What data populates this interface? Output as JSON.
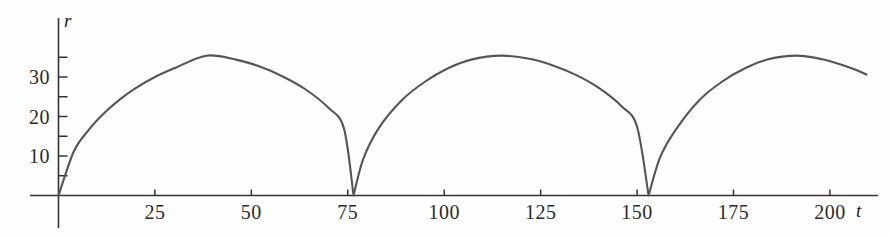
{
  "chart_data": {
    "type": "line",
    "title": "",
    "subtitle": "",
    "xlabel": "t",
    "ylabel": "r",
    "xlim": [
      -2,
      212
    ],
    "ylim": [
      0,
      39
    ],
    "grid": false,
    "legend": null,
    "x_ticks": [
      25,
      50,
      75,
      100,
      125,
      150,
      175,
      200
    ],
    "x_tick_labels": [
      "25",
      "50",
      "75",
      "100",
      "125",
      "150",
      "175",
      "200"
    ],
    "x_minor_tick_step": 25,
    "y_ticks": [
      5,
      10,
      15,
      20,
      25,
      30,
      35
    ],
    "y_tick_labels": [
      "",
      "10",
      "",
      "20",
      "",
      "30",
      ""
    ],
    "y_labeled_ticks": [
      10,
      20,
      30
    ],
    "line_color": "#555555",
    "axis_color": "#333333",
    "series": [
      {
        "name": "r(t)",
        "description": "periodic cycloid-like arcs with cusps at t = 0, 76.5, 153",
        "period": 76.5,
        "amplitude_max": 35.4,
        "cusps": [
          0,
          76.5,
          153
        ],
        "peaks": [
          {
            "x": 38.3,
            "y": 35.4
          },
          {
            "x": 114.8,
            "y": 35.4
          },
          {
            "x": 191.3,
            "y": 35.4
          }
        ],
        "x": [
          0,
          4,
          8,
          12,
          16,
          20,
          25,
          30,
          38.3,
          46,
          52,
          58,
          64,
          70,
          74,
          76.5,
          79,
          83,
          89,
          95,
          101,
          107,
          114.8,
          122,
          128,
          134,
          140,
          146,
          150,
          153,
          156,
          160,
          166,
          172,
          178,
          184,
          191.3,
          198,
          203,
          207,
          209.5
        ],
        "y": [
          0,
          11.2,
          16.8,
          21.0,
          24.4,
          27.2,
          30.0,
          32.2,
          35.4,
          34.4,
          32.7,
          30.2,
          26.9,
          22.2,
          17.0,
          0,
          9.2,
          17.0,
          24.1,
          28.8,
          32.2,
          34.4,
          35.4,
          34.6,
          33.0,
          30.6,
          27.3,
          22.6,
          17.4,
          0,
          9.7,
          16.6,
          24.0,
          28.8,
          32.2,
          34.5,
          35.4,
          34.5,
          33.1,
          31.7,
          30.6
        ]
      }
    ]
  },
  "axes": {
    "y_axis_name": "r",
    "x_axis_name": "t"
  }
}
